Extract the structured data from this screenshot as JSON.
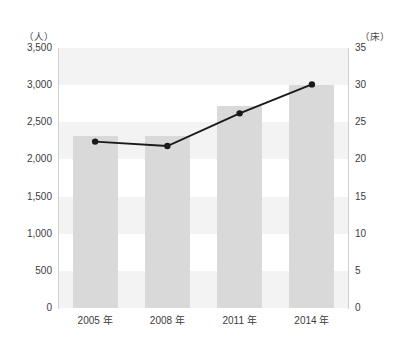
{
  "chart_data": {
    "type": "bar",
    "title": "",
    "subtitle": "",
    "categories": [
      "2005 年",
      "2008 年",
      "2011 年",
      "2014 年"
    ],
    "series": [
      {
        "name": "人",
        "type": "bar",
        "axis": "left",
        "values": [
          2320,
          2320,
          2720,
          3000
        ],
        "color": "#d9d9d9"
      },
      {
        "name": "床",
        "type": "line",
        "axis": "right",
        "values": [
          22.4,
          21.8,
          26.2,
          30.1
        ],
        "color": "#1a1a1a"
      }
    ],
    "xlabel": "",
    "ylabel": "",
    "left_axis": {
      "unit_label": "（人）",
      "ticks": [
        "3,500",
        "3,000",
        "2,500",
        "2,000",
        "1,500",
        "1,000",
        "500",
        "0"
      ],
      "values": [
        3500,
        3000,
        2500,
        2000,
        1500,
        1000,
        500,
        0
      ],
      "ylim": [
        0,
        3500
      ]
    },
    "right_axis": {
      "unit_label": "（床）",
      "ticks": [
        "35",
        "30",
        "25",
        "20",
        "15",
        "10",
        "5",
        "0"
      ],
      "values": [
        35,
        30,
        25,
        20,
        15,
        10,
        5,
        0
      ],
      "ylim": [
        0,
        35
      ]
    },
    "grid": "horizontal-bands",
    "legend": "none",
    "background": "#ffffff",
    "band_tint_color": "#f3f3f3"
  }
}
